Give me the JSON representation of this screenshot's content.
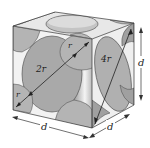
{
  "diagram": {
    "type": "face-centered-cubic-unit-cell",
    "labels": {
      "face_diagonal_radius_top": "r",
      "face_diagonal_diameter": "2r",
      "face_diagonal_radius_bottom": "r",
      "right_face_diagonal": "4r",
      "edge_height": "d",
      "edge_front_width": "d",
      "edge_side_depth": "d"
    },
    "colors": {
      "sphere_fill": "#a9a9a9",
      "sphere_light": "#cfcfcf",
      "face_edge": "#333333",
      "background": "#ffffff"
    }
  }
}
